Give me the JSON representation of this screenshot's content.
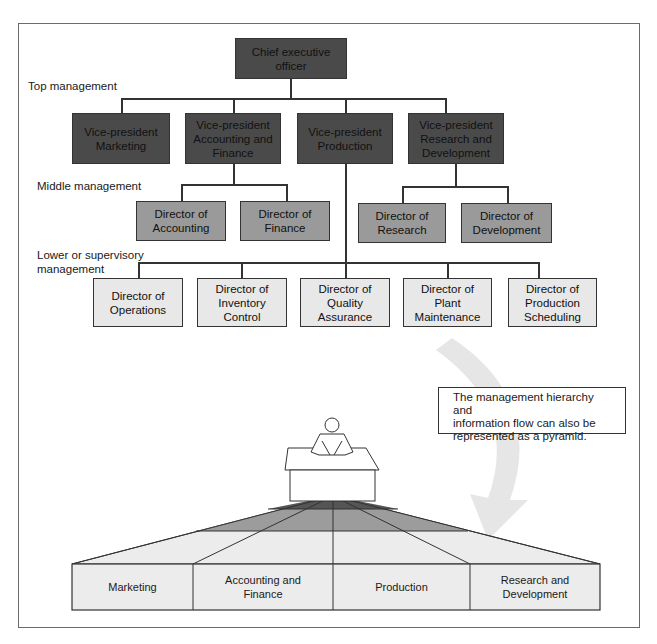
{
  "levels": {
    "top": "Top management",
    "middle": "Middle management",
    "lower": "Lower or supervisory\nmanagement"
  },
  "ceo": "Chief executive\nofficer",
  "vice_presidents": [
    "Vice-president\nMarketing",
    "Vice-president\nAccounting and\nFinance",
    "Vice-president\nProduction",
    "Vice-president\nResearch and\nDevelopment"
  ],
  "middle_directors": [
    "Director of\nAccounting",
    "Director of\nFinance",
    "Director of\nResearch",
    "Director of\nDevelopment"
  ],
  "lower_directors": [
    "Director of\nOperations",
    "Director of\nInventory\nControl",
    "Director of\nQuality\nAssurance",
    "Director of\nPlant\nMaintenance",
    "Director of\nProduction\nScheduling"
  ],
  "note": "The management hierarchy and\ninformation flow can also be\nrepresented as a pyramid.",
  "pyramid_sections": [
    "Marketing",
    "Accounting and\nFinance",
    "Production",
    "Research and\nDevelopment"
  ],
  "colors": {
    "top": "#4a4a4a",
    "middle": "#9a9a9a",
    "lower": "#e8e8e8",
    "arrow": "#e6e6e6"
  }
}
